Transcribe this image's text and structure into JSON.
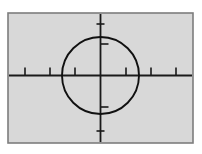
{
  "figure": {
    "canvas": {
      "width": 202,
      "height": 154,
      "background": "#ffffff"
    },
    "frame": {
      "label": "plot-frame",
      "x": 8,
      "y": 13,
      "width": 185,
      "height": 130,
      "fill": "#d8d8d8",
      "stroke": "#7d7d7d",
      "stroke_width": 1.6
    },
    "axes": {
      "center_x": 100.5,
      "center_y": 75.5,
      "stroke": "#1a1a1a",
      "stroke_width": 1.8,
      "horizontal": {
        "label": "horizontal-axis",
        "x1": 9,
        "x2": 192,
        "y": 75.5
      },
      "vertical": {
        "label": "vertical-axis",
        "y1": 14,
        "y2": 142,
        "x": 100.5
      }
    },
    "circle": {
      "label": "reticle-circle",
      "cx": 100.5,
      "cy": 75.5,
      "r": 38.5,
      "stroke": "#111111",
      "stroke_width": 1.9,
      "fill": "none"
    },
    "ticks": {
      "stroke": "#1a1a1a",
      "stroke_width": 1.6,
      "horizontal_length": 8,
      "vertical_length": 8,
      "horizontal_positions": [
        25,
        50,
        75,
        126,
        151,
        176
      ],
      "horizontal_inner_positions": [
        75,
        126
      ],
      "vertical_positions": [
        44,
        107
      ],
      "vertical_top_end": 24,
      "vertical_bottom_end": 131
    },
    "legend": {
      "visible": false,
      "entries": []
    },
    "annotations": []
  },
  "chart_data": {
    "type": "scatter",
    "xlabel": "",
    "ylabel": "",
    "grid": false,
    "legend_position": "none",
    "xlim": [
      -100.5,
      101.5
    ],
    "ylim": [
      -75.5,
      78.5
    ],
    "series": [
      {
        "name": "circle",
        "shape": "circle",
        "center": [
          0,
          0
        ],
        "radius": 38.5,
        "values": []
      },
      {
        "name": "horizontal-axis",
        "shape": "line",
        "x": [
          -91.5,
          91.5
        ],
        "y": [
          0,
          0
        ]
      },
      {
        "name": "vertical-axis",
        "shape": "line",
        "x": [
          0,
          0
        ],
        "y": [
          -66.5,
          61.5
        ]
      }
    ],
    "tick_values_x": [
      -75.5,
      -50.5,
      -25.5,
      25.5,
      50.5,
      75.5
    ],
    "tick_values_y": [
      -31.5,
      31.5
    ]
  }
}
